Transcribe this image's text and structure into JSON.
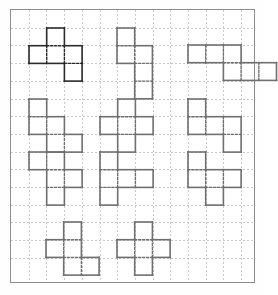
{
  "page": {
    "background_color": "#fefefe",
    "paper_color": "#ffffff",
    "border_color": "#8d8d8d"
  },
  "grid": {
    "origin_x": 10,
    "origin_y": 9,
    "width": 245,
    "height": 274,
    "cell_size": 17.7,
    "columns": 14,
    "rows": 15,
    "line_color": "#c9c9c9",
    "line_style": "dotted"
  },
  "shapes": {
    "stroke_width": 1.6,
    "default_color": "#6f6f6f",
    "highlight_color": "#2a2a2a",
    "count": 11,
    "items": [
      {
        "id": "shape-1",
        "name": "f-pentomino",
        "label": "Shape 1",
        "color": "#2a2a2a",
        "col": 1,
        "row": 1,
        "cells": [
          [
            1,
            0
          ],
          [
            0,
            1
          ],
          [
            1,
            1
          ],
          [
            2,
            1
          ],
          [
            2,
            2
          ]
        ],
        "cell_count": 5
      },
      {
        "id": "shape-2",
        "name": "f-pentomino",
        "label": "Shape 2",
        "color": "#6f6f6f",
        "col": 6,
        "row": 1,
        "cells": [
          [
            0,
            0
          ],
          [
            0,
            1
          ],
          [
            1,
            1
          ],
          [
            1,
            2
          ],
          [
            1,
            3
          ]
        ],
        "cell_count": 5
      },
      {
        "id": "shape-3",
        "name": "n-pentomino",
        "label": "Shape 3",
        "color": "#6f6f6f",
        "col": 10,
        "row": 2,
        "cells": [
          [
            0,
            0
          ],
          [
            1,
            0
          ],
          [
            2,
            0
          ],
          [
            2,
            1
          ],
          [
            3,
            1
          ],
          [
            4,
            1
          ]
        ],
        "cell_count": 6
      },
      {
        "id": "shape-4",
        "name": "w-pentomino",
        "label": "Shape 4",
        "color": "#6f6f6f",
        "col": 1,
        "row": 5,
        "cells": [
          [
            0,
            0
          ],
          [
            0,
            1
          ],
          [
            1,
            1
          ],
          [
            1,
            2
          ],
          [
            2,
            2
          ]
        ],
        "cell_count": 5
      },
      {
        "id": "shape-5",
        "name": "x-pentomino",
        "label": "Shape 5",
        "color": "#6f6f6f",
        "col": 5,
        "row": 5,
        "cells": [
          [
            1,
            0
          ],
          [
            0,
            1
          ],
          [
            1,
            1
          ],
          [
            2,
            1
          ],
          [
            1,
            2
          ]
        ],
        "cell_count": 5
      },
      {
        "id": "shape-6",
        "name": "n-pentomino",
        "label": "Shape 6",
        "color": "#6f6f6f",
        "col": 10,
        "row": 5,
        "cells": [
          [
            0,
            0
          ],
          [
            0,
            1
          ],
          [
            1,
            1
          ],
          [
            2,
            1
          ],
          [
            2,
            2
          ]
        ],
        "cell_count": 5
      },
      {
        "id": "shape-7",
        "name": "w-pentomino",
        "label": "Shape 7",
        "color": "#6f6f6f",
        "col": 1,
        "row": 8,
        "cells": [
          [
            0,
            0
          ],
          [
            1,
            0
          ],
          [
            1,
            1
          ],
          [
            1,
            2
          ],
          [
            2,
            1
          ]
        ],
        "cell_count": 5
      },
      {
        "id": "shape-8",
        "name": "y-pentomino",
        "label": "Shape 8",
        "color": "#6f6f6f",
        "col": 5,
        "row": 8,
        "cells": [
          [
            0,
            0
          ],
          [
            0,
            1
          ],
          [
            1,
            1
          ],
          [
            2,
            1
          ],
          [
            0,
            2
          ]
        ],
        "cell_count": 5
      },
      {
        "id": "shape-9",
        "name": "s-pentomino",
        "label": "Shape 9",
        "color": "#6f6f6f",
        "col": 10,
        "row": 8,
        "cells": [
          [
            0,
            0
          ],
          [
            0,
            1
          ],
          [
            1,
            1
          ],
          [
            2,
            1
          ],
          [
            1,
            2
          ]
        ],
        "cell_count": 5
      },
      {
        "id": "shape-10",
        "name": "w-pentomino",
        "label": "Shape 10",
        "color": "#6f6f6f",
        "col": 2,
        "row": 12,
        "cells": [
          [
            1,
            0
          ],
          [
            0,
            1
          ],
          [
            1,
            1
          ],
          [
            1,
            2
          ],
          [
            2,
            2
          ]
        ],
        "cell_count": 5
      },
      {
        "id": "shape-11",
        "name": "x-pentomino",
        "label": "Shape 11",
        "color": "#6f6f6f",
        "col": 6,
        "row": 12,
        "cells": [
          [
            1,
            0
          ],
          [
            0,
            1
          ],
          [
            1,
            1
          ],
          [
            2,
            1
          ],
          [
            1,
            2
          ]
        ],
        "cell_count": 5
      }
    ]
  }
}
